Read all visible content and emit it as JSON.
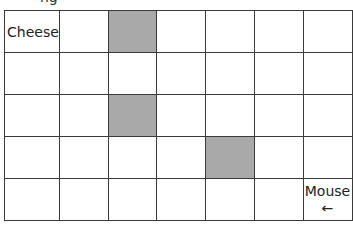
{
  "caption": "ng",
  "grid": {
    "rows": 5,
    "cols": 7,
    "shaded_cells": [
      [
        0,
        2
      ],
      [
        2,
        2
      ],
      [
        3,
        4
      ]
    ],
    "labels": {
      "cheese": {
        "row": 0,
        "col": 0,
        "text": "Cheese"
      },
      "mouse": {
        "row": 4,
        "col": 6,
        "text": "Mouse",
        "arrow": "←"
      }
    },
    "colors": {
      "shade": "#a9a9a9",
      "line": "#3a3a3a"
    }
  }
}
